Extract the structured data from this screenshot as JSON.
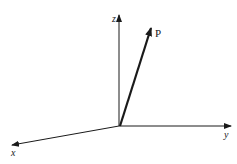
{
  "diagram": {
    "title": "",
    "axes": {
      "z": {
        "label": "z"
      },
      "y": {
        "label": "y"
      },
      "x": {
        "label": "x"
      }
    },
    "vector": {
      "label": "P"
    },
    "colors": {
      "line": "#1a1a1a",
      "background": "#ffffff"
    }
  }
}
